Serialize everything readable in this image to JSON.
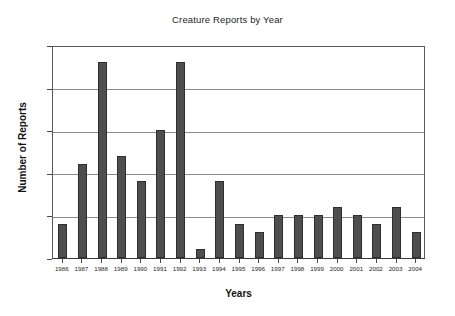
{
  "chart_data": {
    "type": "bar",
    "title": "Creature Reports by Year",
    "xlabel": "Years",
    "ylabel": "Number of Reports",
    "categories": [
      "1986",
      "1987",
      "1988",
      "1989",
      "1990",
      "1991",
      "1992",
      "1993",
      "1994",
      "1995",
      "1996",
      "1997",
      "1998",
      "1999",
      "2000",
      "2001",
      "2002",
      "2003",
      "2004"
    ],
    "values": [
      4,
      11,
      23,
      12,
      9,
      15,
      23,
      1,
      9,
      4,
      3,
      5,
      5,
      5,
      6,
      5,
      4,
      6,
      3
    ],
    "ylim": [
      0,
      25
    ],
    "yticks": [
      0,
      5,
      10,
      15,
      20,
      25
    ],
    "grid": "horizontal",
    "legend": "none",
    "bar_color": "#4e4e4e",
    "bar_edge_color": "#2e2e2e",
    "gridline_color": "#8a8a8a",
    "axis_color": "#3a3a3a",
    "background_color": "#ffffff"
  }
}
